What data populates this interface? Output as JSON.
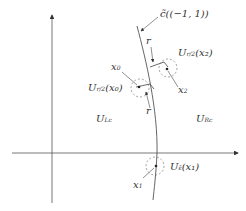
{
  "diagram": {
    "labels": {
      "c_tilde": "c̃((−1, 1))",
      "r_top": "r",
      "r_left": "r",
      "r_bottom": "r",
      "x0": "x",
      "x0_sub": "0",
      "x2": "x",
      "x2_sub": "2",
      "x1": "x",
      "x1_sub": "1",
      "U_x2": "U",
      "U_x2_sub": "r/2",
      "U_x2_arg": "(x₂)",
      "U_x0": "U",
      "U_x0_sub": "r/2",
      "U_x0_arg": "(x₀)",
      "U_x1": "U",
      "U_x1_sub": "ε̃",
      "U_x1_arg": "(x₁)",
      "UL": "U",
      "UL_sup": "L",
      "UL_sub": "c",
      "UR": "U",
      "UR_sup": "R",
      "UR_sub": "c"
    },
    "colors": {
      "stroke": "#444444",
      "text": "#333333"
    }
  }
}
